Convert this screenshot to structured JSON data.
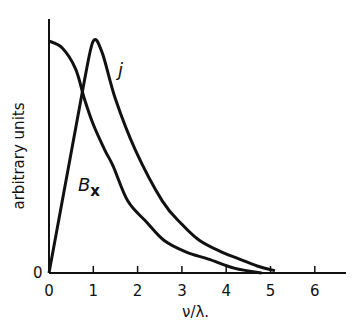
{
  "chart_data": {
    "type": "line",
    "title": "",
    "xlabel": "ν/λ.",
    "ylabel": "arbitrary units",
    "xlim": [
      0,
      6.7
    ],
    "ylim": [
      0,
      1.1
    ],
    "x_ticks": [
      "0",
      "1",
      "2",
      "3",
      "4",
      "5",
      "6"
    ],
    "y_ticks": [
      "0"
    ],
    "grid": false,
    "legend": "none (curves labeled inline)",
    "series": [
      {
        "name": "B_x",
        "label_main": "B",
        "label_sub": "x",
        "x": [
          0,
          0.3,
          0.6,
          0.8,
          1.0,
          1.26,
          1.45,
          1.78,
          2.2,
          2.6,
          3.1,
          3.6,
          4.2,
          4.8
        ],
        "values": [
          1.0,
          0.97,
          0.88,
          0.75,
          0.64,
          0.53,
          0.46,
          0.31,
          0.22,
          0.14,
          0.09,
          0.06,
          0.02,
          0.0
        ]
      },
      {
        "name": "j",
        "label_main": "j",
        "x": [
          0,
          0.5,
          0.8,
          1.0,
          1.2,
          1.5,
          1.95,
          2.56,
          3.0,
          3.4,
          3.9,
          4.3,
          4.7,
          5.1
        ],
        "values": [
          0.0,
          0.5,
          0.83,
          1.0,
          0.95,
          0.75,
          0.53,
          0.31,
          0.21,
          0.14,
          0.09,
          0.06,
          0.03,
          0.01
        ]
      }
    ]
  }
}
